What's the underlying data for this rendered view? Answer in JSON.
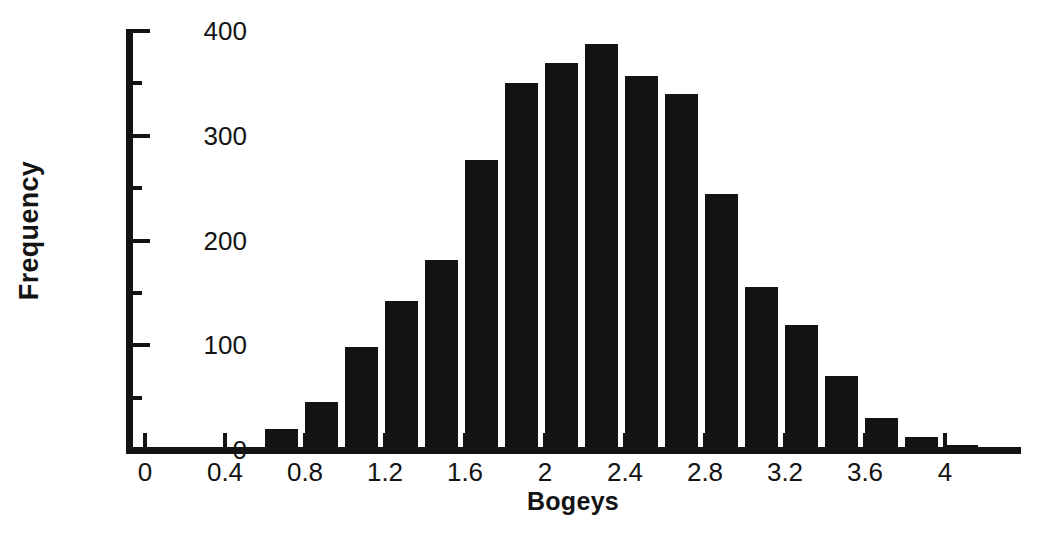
{
  "chart_data": {
    "type": "bar",
    "title": "",
    "subtitle": "",
    "xlabel": "Bogeys",
    "ylabel": "Frequency",
    "xlim": [
      -0.1,
      4.3
    ],
    "ylim": [
      0,
      400
    ],
    "grid": false,
    "legend": null,
    "bin_width": 0.2,
    "bar_color": "#131313",
    "axis_color": "#131313",
    "background_color": "#ffffff",
    "x_ticks": [
      {
        "value": 0,
        "label": "0"
      },
      {
        "value": 0.4,
        "label": "0.4"
      },
      {
        "value": 0.8,
        "label": "0.8"
      },
      {
        "value": 1.2,
        "label": "1.2"
      },
      {
        "value": 1.6,
        "label": "1.6"
      },
      {
        "value": 2.0,
        "label": "2"
      },
      {
        "value": 2.4,
        "label": "2.4"
      },
      {
        "value": 2.8,
        "label": "2.8"
      },
      {
        "value": 3.2,
        "label": "3.2"
      },
      {
        "value": 3.6,
        "label": "3.6"
      },
      {
        "value": 4.0,
        "label": "4"
      }
    ],
    "y_ticks_major": [
      {
        "value": 0,
        "label": "0"
      },
      {
        "value": 100,
        "label": "100"
      },
      {
        "value": 200,
        "label": "200"
      },
      {
        "value": 300,
        "label": "300"
      },
      {
        "value": 400,
        "label": "400"
      }
    ],
    "y_ticks_minor": [
      50,
      150,
      250,
      350
    ],
    "categories": [
      "0.0",
      "0.2",
      "0.4",
      "0.6",
      "0.8",
      "1.0",
      "1.2",
      "1.4",
      "1.6",
      "1.8",
      "2.0",
      "2.2",
      "2.4",
      "2.6",
      "2.8",
      "3.0",
      "3.2",
      "3.4",
      "3.6",
      "3.8",
      "4.0",
      "4.2"
    ],
    "bin_centers": [
      0.1,
      0.3,
      0.5,
      0.7,
      0.9,
      1.1,
      1.3,
      1.5,
      1.7,
      1.9,
      2.1,
      2.3,
      2.5,
      2.7,
      2.9,
      3.1,
      3.3,
      3.5,
      3.7,
      3.9,
      4.1,
      4.3
    ],
    "values": [
      0,
      0,
      0,
      20,
      46,
      98,
      142,
      181,
      277,
      350,
      369,
      388,
      357,
      340,
      244,
      156,
      119,
      71,
      31,
      12,
      5,
      0
    ]
  }
}
